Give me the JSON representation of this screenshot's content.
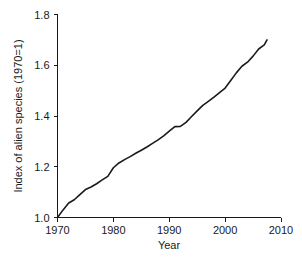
{
  "chart_data": {
    "type": "line",
    "title": "",
    "xlabel": "Year",
    "ylabel": "Index of alien species (1970=1)",
    "xlim": [
      1970,
      2010
    ],
    "ylim": [
      1.0,
      1.8
    ],
    "grid": false,
    "legend": null,
    "line_color": "#1a1a1a",
    "background_color": "#ffffff",
    "xticks": [
      1970,
      1980,
      1990,
      2000,
      2010
    ],
    "xtick_labels": [
      "1970",
      "1980",
      "1990",
      "2000",
      "2010"
    ],
    "yticks": [
      1.0,
      1.2,
      1.4,
      1.6,
      1.8
    ],
    "ytick_labels": [
      "1.0",
      "1.2",
      "1.4",
      "1.6",
      "1.8"
    ],
    "series": [
      {
        "name": "Index of alien species",
        "x": [
          1970,
          1971,
          1972,
          1973,
          1974,
          1975,
          1976,
          1977,
          1978,
          1979,
          1980,
          1981,
          1982,
          1983,
          1984,
          1985,
          1986,
          1987,
          1988,
          1989,
          1990,
          1991,
          1992,
          1993,
          1994,
          1995,
          1996,
          1997,
          1998,
          1999,
          2000,
          2001,
          2002,
          2003,
          2004,
          2005,
          2006,
          2007,
          2007.5
        ],
        "values": [
          1.0,
          1.03,
          1.057,
          1.07,
          1.09,
          1.11,
          1.12,
          1.133,
          1.148,
          1.162,
          1.196,
          1.215,
          1.228,
          1.24,
          1.253,
          1.265,
          1.278,
          1.292,
          1.306,
          1.322,
          1.34,
          1.358,
          1.359,
          1.375,
          1.398,
          1.42,
          1.442,
          1.458,
          1.474,
          1.492,
          1.51,
          1.54,
          1.57,
          1.596,
          1.612,
          1.636,
          1.664,
          1.68,
          1.7
        ]
      }
    ]
  },
  "axes": {
    "x_axis_name": "year-axis",
    "y_axis_name": "index-axis"
  }
}
